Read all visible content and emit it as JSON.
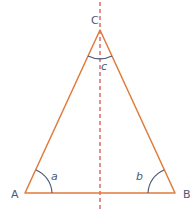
{
  "diagram": {
    "type": "isosceles-triangle",
    "vertices": [
      {
        "name": "A",
        "label": "A"
      },
      {
        "name": "B",
        "label": "B"
      },
      {
        "name": "C",
        "label": "C"
      }
    ],
    "angles": [
      {
        "vertex": "A",
        "label": "a"
      },
      {
        "vertex": "B",
        "label": "b"
      },
      {
        "vertex": "C",
        "label": "c"
      }
    ],
    "symmetry_axis": "dashed vertical line through C",
    "colors": {
      "triangle": "#e07b3c",
      "axis": "#d9534f",
      "arc": "#4a5a78",
      "label": "#4a5a78"
    }
  }
}
